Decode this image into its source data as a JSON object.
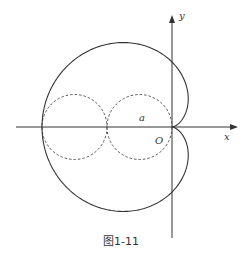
{
  "figure": {
    "caption": "图1-11",
    "labels": {
      "x_axis": "x",
      "y_axis": "y",
      "origin": "O",
      "radius": "a"
    },
    "geometry": {
      "origin": [
        172,
        127
      ],
      "a_px": 32.5,
      "x_axis": {
        "from": 16,
        "to": 238
      },
      "y_axis": {
        "from": 238,
        "to": 15
      },
      "circles": [
        {
          "cx": 139.5,
          "cy": 127,
          "r": 32.5,
          "style": "dashed"
        },
        {
          "cx": 74.5,
          "cy": 127,
          "r": 32.5,
          "style": "dashed"
        }
      ],
      "cardioid": "r = 2a(1 - cos θ)"
    },
    "colors": {
      "stroke": "#333333",
      "background": "#ffffff"
    }
  }
}
